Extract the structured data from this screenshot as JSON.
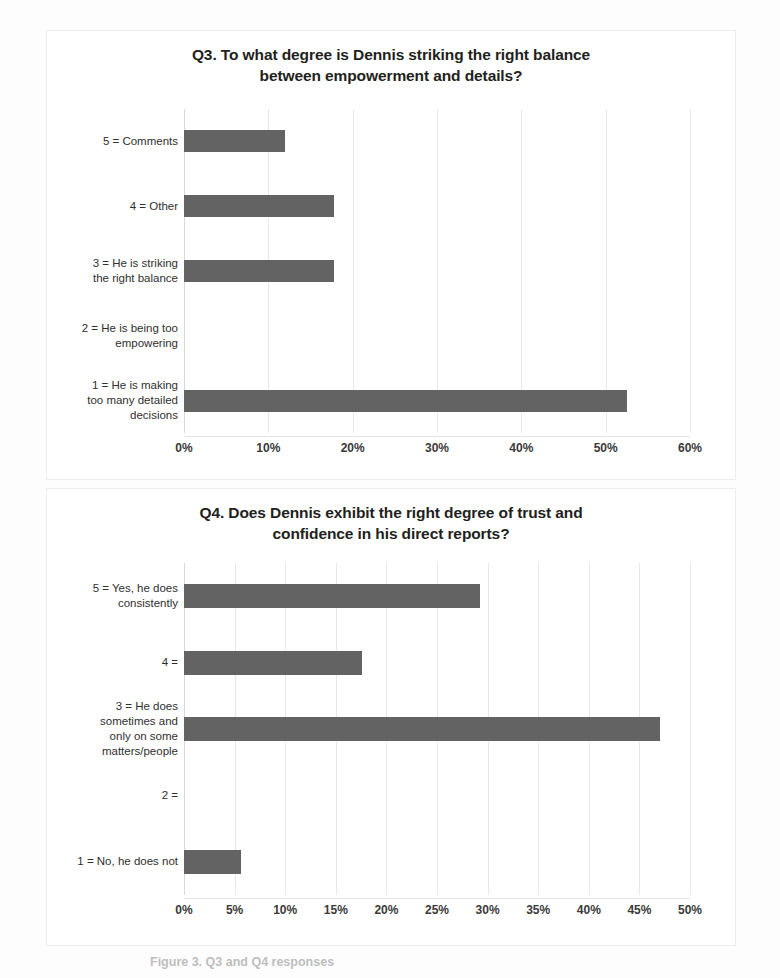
{
  "document": {
    "caption": "Figure 3. Q3 and Q4 responses"
  },
  "colors": {
    "bar": "#636363",
    "gridline": "#e9e9e9",
    "text": "#2f2f2f",
    "title": "#231f20",
    "card_border": "#ededed",
    "background": "#fdfdfd"
  },
  "charts": [
    {
      "id": "q3",
      "title_line1": "Q3. To what degree is Dennis striking the right balance",
      "title_line2": "between empowerment and details?"
    },
    {
      "id": "q4",
      "title_line1": "Q4. Does Dennis exhibit the right degree of trust and",
      "title_line2": "confidence in his direct reports?"
    }
  ],
  "chart_data": [
    {
      "type": "bar",
      "orientation": "horizontal",
      "title": "Q3. To what degree is Dennis striking the right balance between empowerment and details?",
      "xlabel": "",
      "ylabel": "",
      "xlim": [
        0,
        60
      ],
      "xticks": [
        0,
        10,
        20,
        30,
        40,
        50,
        60
      ],
      "xticklabels": [
        "0%",
        "10%",
        "20%",
        "30%",
        "40%",
        "50%",
        "60%"
      ],
      "grid": true,
      "legend": "none",
      "unit": "%",
      "categories": [
        "1 = He is making\ntoo many detailed\ndecisions",
        "2 = He is being too\nempowering",
        "3 = He is striking\nthe right balance",
        "4 = Other",
        "5 = Comments"
      ],
      "values": [
        52.5,
        0,
        17.8,
        17.8,
        12.0
      ]
    },
    {
      "type": "bar",
      "orientation": "horizontal",
      "title": "Q4. Does Dennis exhibit the right degree of trust and confidence in his direct reports?",
      "xlabel": "",
      "ylabel": "",
      "xlim": [
        0,
        50
      ],
      "xticks": [
        0,
        5,
        10,
        15,
        20,
        25,
        30,
        35,
        40,
        45,
        50
      ],
      "xticklabels": [
        "0%",
        "5%",
        "10%",
        "15%",
        "20%",
        "25%",
        "30%",
        "35%",
        "40%",
        "45%",
        "50%"
      ],
      "grid": true,
      "legend": "none",
      "unit": "%",
      "categories": [
        "1 = No, he does not",
        "2 =",
        "3 = He does\nsometimes and\nonly on some\nmatters/people",
        "4 =",
        "5 = Yes, he does\nconsistently"
      ],
      "values": [
        5.6,
        0,
        47.0,
        17.6,
        29.2
      ]
    }
  ]
}
